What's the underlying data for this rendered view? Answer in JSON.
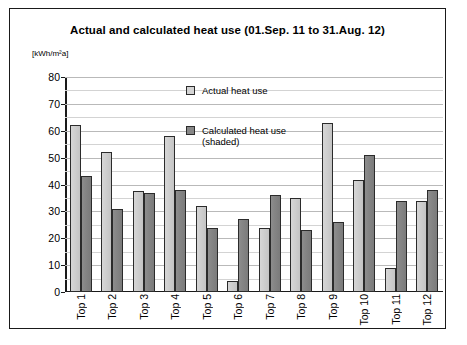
{
  "chart_data": {
    "type": "bar",
    "title": "Actual and calculated heat use (01.Sep. 11 to 31.Aug. 12)",
    "unit_label": "[kWh/m²a]",
    "xlabel": "",
    "ylabel": "",
    "ylim": [
      0,
      80
    ],
    "ytick_step": 10,
    "yticks": [
      0,
      10,
      20,
      30,
      40,
      50,
      60,
      70,
      80
    ],
    "minor_gridlines": true,
    "minor_gridline_step": 5,
    "grid": true,
    "legend_position": "inside-top-center",
    "categories": [
      "Top 1",
      "Top 2",
      "Top 3",
      "Top 4",
      "Top 5",
      "Top 6",
      "Top 7",
      "Top 8",
      "Top 9",
      "Top 10",
      "Top 11",
      "Top 12"
    ],
    "series": [
      {
        "name": "Actual heat use",
        "color": "#d0d0d0",
        "values": [
          62,
          52,
          37.5,
          58,
          32,
          4,
          24,
          35,
          63,
          41.5,
          9,
          34
        ]
      },
      {
        "name": "Calculated heat use (shaded)",
        "color": "#858585",
        "values": [
          43,
          31,
          37,
          38,
          24,
          27,
          36,
          23,
          26,
          51,
          34,
          38
        ]
      }
    ]
  },
  "legend": {
    "actual": "Actual heat use",
    "calculated_line1": "Calculated heat use",
    "calculated_line2": "(shaded)"
  }
}
